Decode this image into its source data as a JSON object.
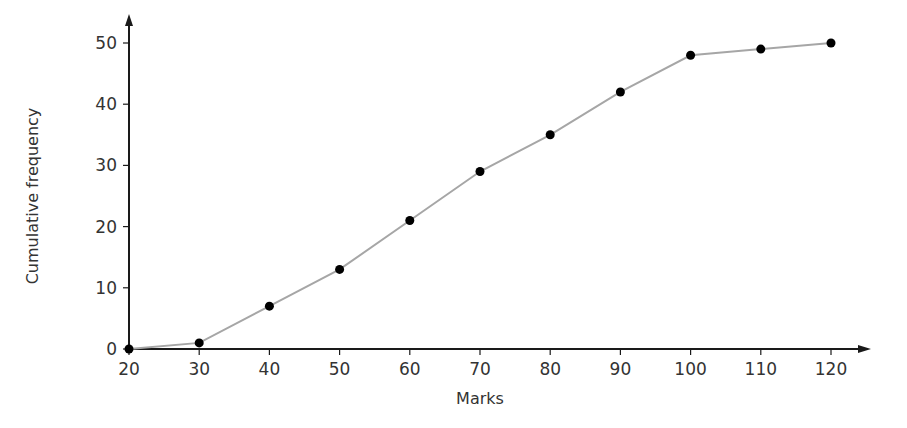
{
  "chart_data": {
    "type": "line",
    "title": "",
    "xlabel": "Marks",
    "ylabel": "Cumulative frequency",
    "x": [
      20,
      30,
      40,
      50,
      60,
      70,
      80,
      90,
      100,
      110,
      120
    ],
    "series": [
      {
        "name": "Cumulative frequency",
        "values": [
          0,
          1,
          7,
          13,
          21,
          29,
          35,
          42,
          48,
          49,
          50
        ]
      }
    ],
    "x_ticks": [
      20,
      30,
      40,
      50,
      60,
      70,
      80,
      90,
      100,
      110,
      120
    ],
    "y_ticks": [
      0,
      10,
      20,
      30,
      40,
      50
    ],
    "xlim": [
      20,
      120
    ],
    "ylim": [
      0,
      50
    ],
    "grid": false,
    "legend": null,
    "markers": "filled-circle"
  },
  "colors": {
    "axis": "#1a1a1a",
    "line": "#a6a6a6",
    "marker": "#000000",
    "text": "#333333"
  }
}
